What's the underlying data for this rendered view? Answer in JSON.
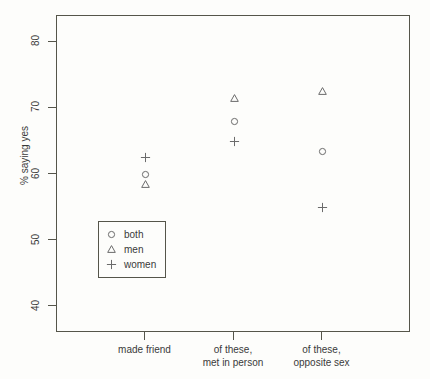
{
  "chart_data": {
    "type": "scatter",
    "title": "",
    "xlabel": "",
    "ylabel": "% saying yes",
    "ylim": [
      36,
      84
    ],
    "xlim": [
      0,
      4
    ],
    "grid": false,
    "legend_position": "inner-left-lower",
    "categories": [
      "made friend",
      "of these,\nmet in person",
      "of these,\nopposite sex"
    ],
    "category_lines": [
      {
        "line1": "made friend",
        "line2": ""
      },
      {
        "line1": "of these,",
        "line2": "met in person"
      },
      {
        "line1": "of these,",
        "line2": "opposite sex"
      }
    ],
    "x_positions": [
      1,
      2,
      3
    ],
    "yticks": [
      40,
      50,
      60,
      70,
      80
    ],
    "series": [
      {
        "name": "both",
        "marker": "circle",
        "values": [
          60.0,
          68.0,
          63.5
        ]
      },
      {
        "name": "men",
        "marker": "triangle",
        "values": [
          58.5,
          71.5,
          72.5
        ]
      },
      {
        "name": "women",
        "marker": "plus",
        "values": [
          62.5,
          65.0,
          55.0
        ]
      }
    ],
    "points": [
      {
        "series": "both",
        "marker": "circle",
        "category": "made friend",
        "x": 1,
        "y": 60.0
      },
      {
        "series": "men",
        "marker": "triangle",
        "category": "made friend",
        "x": 1,
        "y": 58.5
      },
      {
        "series": "women",
        "marker": "plus",
        "category": "made friend",
        "x": 1,
        "y": 62.5
      },
      {
        "series": "both",
        "marker": "circle",
        "category": "of these, met in person",
        "x": 2,
        "y": 68.0
      },
      {
        "series": "men",
        "marker": "triangle",
        "category": "of these, met in person",
        "x": 2,
        "y": 71.5
      },
      {
        "series": "women",
        "marker": "plus",
        "category": "of these, met in person",
        "x": 2,
        "y": 65.0
      },
      {
        "series": "both",
        "marker": "circle",
        "category": "of these, opposite sex",
        "x": 3,
        "y": 63.5
      },
      {
        "series": "men",
        "marker": "triangle",
        "category": "of these, opposite sex",
        "x": 3,
        "y": 72.5
      },
      {
        "series": "women",
        "marker": "plus",
        "category": "of these, opposite sex",
        "x": 3,
        "y": 55.0
      }
    ],
    "legend": [
      {
        "label": "both",
        "marker": "circle"
      },
      {
        "label": "men",
        "marker": "triangle"
      },
      {
        "label": "women",
        "marker": "plus"
      }
    ],
    "colors": {
      "marker": "#6b6b6b",
      "axis": "#55554a",
      "text": "#3a3a3a",
      "background": "#fdfdfb"
    }
  }
}
